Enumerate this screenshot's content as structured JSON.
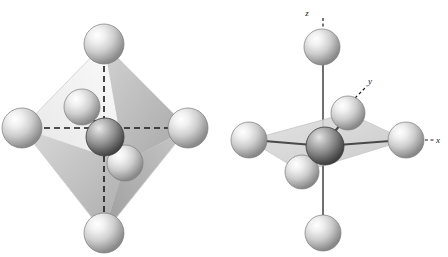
{
  "figure": {
    "background_color": "#ffffff",
    "width": 448,
    "height": 257,
    "panel_count": 2
  },
  "colors": {
    "ligand_sphere_light": "#f4f4f4",
    "ligand_sphere_mid": "#c9c9c9",
    "ligand_sphere_dark": "#8f8f8f",
    "ligand_sphere_edge": "#6e6e6e",
    "central_sphere_light": "#d8d8d8",
    "central_sphere_mid": "#9a9a9a",
    "central_sphere_dark": "#4f4f4f",
    "central_sphere_edge": "#3a3a3a",
    "face_light": "#ededed",
    "face_mid": "#dcdcdc",
    "face_dark": "#b4b4b4",
    "face_darkest": "#a0a0a0",
    "plane_fill": "#d6d6d6",
    "plane_edge": "#b8b8b8",
    "bond_line": "#4a4a4a",
    "dashed_axis": "#1a1a1a",
    "axis_solid": "#707070",
    "label_text": "#1a1a1a"
  },
  "panels": [
    {
      "name": "octahedron-polyhedron-view",
      "caption": "",
      "has_polyhedron": true,
      "bond_style": "dashed",
      "atoms": [
        {
          "id": "top",
          "role": "ligand",
          "label": "",
          "cx": 104,
          "cy": 44,
          "r": 20
        },
        {
          "id": "bottom",
          "role": "ligand",
          "label": "",
          "cx": 104,
          "cy": 233,
          "r": 20
        },
        {
          "id": "left",
          "role": "ligand",
          "label": "",
          "cx": 22,
          "cy": 128,
          "r": 20
        },
        {
          "id": "right",
          "role": "ligand",
          "label": "",
          "cx": 188,
          "cy": 128,
          "r": 20
        },
        {
          "id": "back-upper",
          "role": "ligand",
          "label": "",
          "cx": 82,
          "cy": 107,
          "r": 18
        },
        {
          "id": "front-lower",
          "role": "ligand",
          "label": "",
          "cx": 125,
          "cy": 163,
          "r": 18
        },
        {
          "id": "center",
          "role": "central-metal",
          "label": "",
          "cx": 105,
          "cy": 137,
          "r": 19
        }
      ]
    },
    {
      "name": "octahedron-axes-view",
      "caption": "",
      "has_polyhedron": false,
      "bond_style": "solid",
      "atoms": [
        {
          "id": "top",
          "role": "ligand",
          "label": "",
          "cx": 98,
          "cy": 47,
          "r": 18
        },
        {
          "id": "bottom",
          "role": "ligand",
          "label": "",
          "cx": 99,
          "cy": 233,
          "r": 18
        },
        {
          "id": "left",
          "role": "ligand",
          "label": "",
          "cx": 25,
          "cy": 140,
          "r": 18
        },
        {
          "id": "right",
          "role": "ligand",
          "label": "",
          "cx": 182,
          "cy": 140,
          "r": 18
        },
        {
          "id": "back-upper",
          "role": "ligand",
          "label": "",
          "cx": 124,
          "cy": 113,
          "r": 17
        },
        {
          "id": "front-lower",
          "role": "ligand",
          "label": "",
          "cx": 78,
          "cy": 172,
          "r": 17
        },
        {
          "id": "center",
          "role": "central-metal",
          "label": "",
          "cx": 101,
          "cy": 146,
          "r": 19
        }
      ],
      "axis_labels": [
        {
          "id": "z",
          "text": "z",
          "x": 83,
          "y": 16,
          "leader": "dashed-vertical"
        },
        {
          "id": "y",
          "text": "y",
          "x": 146,
          "y": 84,
          "leader": "dashed-diagonal"
        },
        {
          "id": "x",
          "text": "x",
          "x": 214,
          "y": 143,
          "leader": "dashed-horizontal"
        }
      ]
    }
  ]
}
